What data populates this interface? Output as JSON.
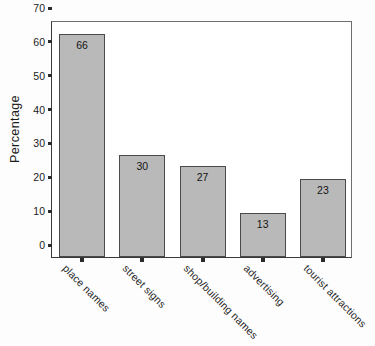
{
  "chart_data": {
    "type": "bar",
    "title": "",
    "xlabel": "",
    "ylabel": "Percentage",
    "categories": [
      "place names",
      "street signs",
      "shop/building names",
      "advertising",
      "tourist attractions"
    ],
    "values": [
      66,
      30,
      27,
      13,
      23
    ],
    "value_labels": [
      "66",
      "30",
      "27",
      "13",
      "23"
    ],
    "ylim": [
      0,
      70
    ],
    "yticks": [
      0,
      10,
      20,
      30,
      40,
      50,
      60,
      70
    ],
    "ytick_labels": [
      "0",
      "10",
      "20",
      "30",
      "40",
      "50",
      "60",
      "70"
    ],
    "grid": false,
    "legend": "none",
    "bar_color": "#b9b9b9",
    "bar_edge_color": "#4a4a4a",
    "axis_color": "#3a3a3a",
    "background_color": "#fdfdfd",
    "xtick_label_rotation": 45
  }
}
